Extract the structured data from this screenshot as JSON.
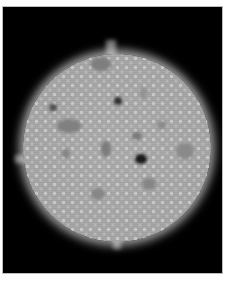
{
  "image": {
    "description": "Grayscale disc with bright halo on black background",
    "colors": {
      "background": "#000000",
      "disc": "#a6a6a6",
      "halo": "#e6e6e6",
      "border": "#bdbdbd",
      "page": "#ffffff"
    },
    "dark_features": [
      {
        "name": "large-dark-spot",
        "x": 140,
        "y": 158,
        "w": 12,
        "h": 10,
        "color": "#1a1a1a"
      },
      {
        "name": "dark-spot-top",
        "x": 117,
        "y": 100,
        "w": 8,
        "h": 8,
        "color": "#303030"
      },
      {
        "name": "dark-spot-left",
        "x": 52,
        "y": 106,
        "w": 8,
        "h": 7,
        "color": "#505050"
      },
      {
        "name": "patch-top",
        "x": 100,
        "y": 63,
        "w": 20,
        "h": 14,
        "color": "#7e7e7e"
      },
      {
        "name": "patch-center-left",
        "x": 68,
        "y": 125,
        "w": 24,
        "h": 14,
        "color": "#808080"
      },
      {
        "name": "patch-center",
        "x": 105,
        "y": 148,
        "w": 10,
        "h": 16,
        "color": "#7c7c7c"
      },
      {
        "name": "patch-right",
        "x": 184,
        "y": 150,
        "w": 18,
        "h": 16,
        "color": "#8a8a8a"
      },
      {
        "name": "patch-lower-right",
        "x": 148,
        "y": 183,
        "w": 14,
        "h": 12,
        "color": "#858585"
      },
      {
        "name": "patch-bottom",
        "x": 97,
        "y": 193,
        "w": 14,
        "h": 12,
        "color": "#878787"
      },
      {
        "name": "spot-mid-right",
        "x": 136,
        "y": 135,
        "w": 10,
        "h": 8,
        "color": "#7a7a7a"
      },
      {
        "name": "spot-right-upper",
        "x": 160,
        "y": 124,
        "w": 9,
        "h": 8,
        "color": "#8a8a8a"
      },
      {
        "name": "spot-left-mid",
        "x": 65,
        "y": 152,
        "w": 8,
        "h": 9,
        "color": "#848484"
      },
      {
        "name": "spot-upper-right",
        "x": 142,
        "y": 92,
        "w": 7,
        "h": 12,
        "color": "#929292"
      }
    ]
  }
}
